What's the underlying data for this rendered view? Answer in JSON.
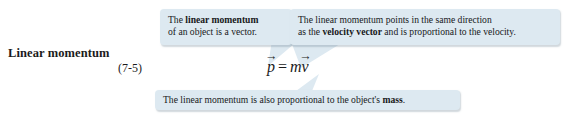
{
  "figure": {
    "equation_label": {
      "title": "Linear momentum",
      "number": "(7-5)"
    },
    "equation": {
      "lhs_symbol": "p",
      "lhs_arrow": "→",
      "operator": "=",
      "rhs_scalar": "m",
      "rhs_symbol": "v",
      "rhs_arrow": "→",
      "plain_text": "p⃗ = mv⃗"
    },
    "callouts": [
      {
        "id": "vector",
        "line1_prefix": "The ",
        "line1_bold": "linear momentum",
        "line2": "of an object is a vector."
      },
      {
        "id": "direction",
        "line1": "The linear momentum points in the same direction",
        "line2_prefix": "as the ",
        "line2_bold": "velocity vector",
        "line2_suffix": " and is proportional to the velocity."
      },
      {
        "id": "mass",
        "text_prefix": "The linear momentum is also proportional to the object's ",
        "text_bold": "mass",
        "text_suffix": "."
      }
    ],
    "colors": {
      "callout_background": "#dde9f1",
      "text": "#17181a",
      "page_background": "#ffffff",
      "tail_fill": "#dde9f1"
    }
  }
}
